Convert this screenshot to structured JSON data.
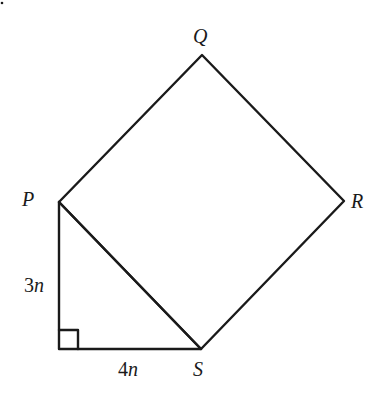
{
  "diagram": {
    "type": "geometry",
    "vertices": {
      "P": {
        "label": "P",
        "x": 59,
        "y": 202
      },
      "Q": {
        "label": "Q",
        "x": 202,
        "y": 55
      },
      "R": {
        "label": "R",
        "x": 344,
        "y": 201
      },
      "S": {
        "label": "S",
        "x": 201,
        "y": 349
      },
      "C": {
        "label": "",
        "x": 59,
        "y": 349
      }
    },
    "labels": {
      "P": "P",
      "Q": "Q",
      "R": "R",
      "S": "S",
      "side_vertical_num": "3",
      "side_vertical_var": "n",
      "side_horizontal_num": "4",
      "side_horizontal_var": "n"
    },
    "edges": [
      [
        "P",
        "Q"
      ],
      [
        "Q",
        "R"
      ],
      [
        "R",
        "S"
      ],
      [
        "S",
        "P"
      ],
      [
        "P",
        "C"
      ],
      [
        "C",
        "S"
      ]
    ],
    "right_angle_marker": {
      "at": "C",
      "size": 19
    },
    "stroke_color": "#1a1a1a"
  }
}
